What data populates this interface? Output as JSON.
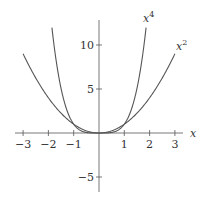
{
  "chart_data": {
    "type": "line",
    "title": "",
    "xlabel": "x",
    "ylabel": "",
    "xlim": [
      -3.3,
      3.3
    ],
    "ylim": [
      -7,
      12.5
    ],
    "grid": false,
    "xticks": [
      -3,
      -2,
      -1,
      1,
      2,
      3
    ],
    "yticks": [
      -5,
      5,
      10
    ],
    "xtick_labels": [
      "−3",
      "−2",
      "−1",
      "1",
      "2",
      "3"
    ],
    "ytick_labels": [
      "−5",
      "5",
      "10"
    ],
    "series": [
      {
        "name": "x^2",
        "label_base": "x",
        "label_exp": "2",
        "x": [
          -3,
          -2.5,
          -2,
          -1.5,
          -1,
          -0.5,
          0,
          0.5,
          1,
          1.5,
          2,
          2.5,
          3
        ],
        "values": [
          9,
          6.25,
          4,
          2.25,
          1,
          0.25,
          0,
          0.25,
          1,
          2.25,
          4,
          6.25,
          9
        ]
      },
      {
        "name": "x^4",
        "label_base": "x",
        "label_exp": "4",
        "x": [
          -1.86,
          -1.5,
          -1.25,
          -1,
          -0.5,
          0,
          0.5,
          1,
          1.25,
          1.5,
          1.86
        ],
        "values": [
          12,
          5.06,
          2.44,
          1,
          0.0625,
          0,
          0.0625,
          1,
          2.44,
          5.06,
          12
        ]
      }
    ]
  }
}
